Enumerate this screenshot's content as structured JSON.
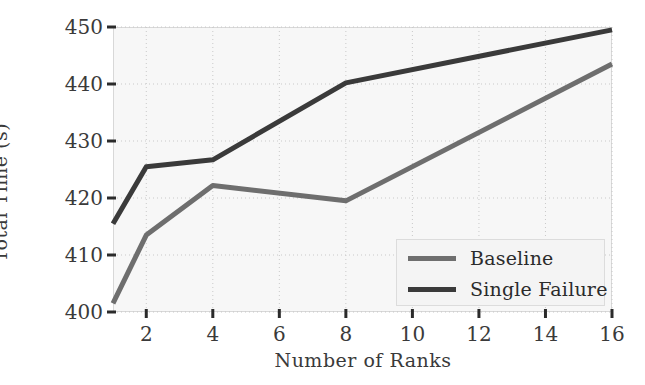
{
  "chart_data": {
    "type": "line",
    "title": "",
    "xlabel": "Number of Ranks",
    "ylabel": "Total Time (s)",
    "x": [
      1,
      2,
      4,
      8,
      16
    ],
    "xlim": [
      1,
      16
    ],
    "ylim": [
      400,
      450
    ],
    "xticks": [
      2,
      4,
      6,
      8,
      10,
      12,
      14,
      16
    ],
    "xtick_labels": [
      "2",
      "4",
      "6",
      "8",
      "10",
      "12",
      "14",
      "16"
    ],
    "yticks": [
      400,
      410,
      420,
      430,
      440,
      450
    ],
    "ytick_labels": [
      "400",
      "410",
      "420",
      "430",
      "440",
      "450"
    ],
    "grid": true,
    "grid_style": "dotted",
    "legend_position": "lower right",
    "series": [
      {
        "name": "Baseline",
        "color": "#6e6e6e",
        "values": [
          401.5,
          413.5,
          422.2,
          419.5,
          443.5
        ]
      },
      {
        "name": "Single Failure",
        "color": "#3a3a3a",
        "values": [
          415.5,
          425.5,
          426.7,
          440.2,
          449.5
        ]
      }
    ]
  },
  "figure": {
    "background": "#ffffff",
    "plot_background": "#f7f7f7",
    "axis_color": "#d8d8d8",
    "text_color": "#3a3a3a"
  }
}
